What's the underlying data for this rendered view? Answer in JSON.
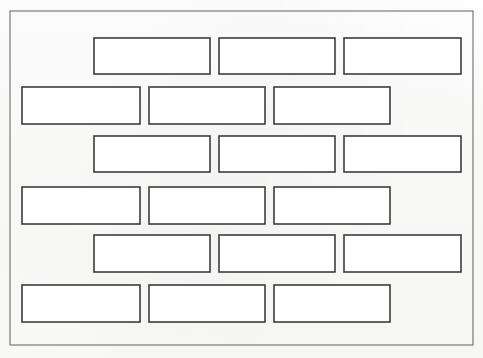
{
  "document": {
    "title": "Brick wall running bond pattern",
    "description": "Hand-drawn line diagram of a brick wall inside a rectangular border",
    "background_color": "#fdfdfc",
    "line_color": "#3c3c3c",
    "frame_color": "#6e6e6e",
    "brick_fill": "#ffffff"
  },
  "canvas": {
    "width": 483,
    "height": 358
  },
  "frame": {
    "name": "outer-border",
    "x": 10,
    "y": 11,
    "width": 463,
    "height": 334
  },
  "wall": {
    "pattern": "running-bond",
    "row_count": 6,
    "brick_count": 21,
    "rows": [
      {
        "index": 1,
        "offset": "indented",
        "bricks": [
          {
            "id": "r1b1",
            "x": 94,
            "y": 38,
            "width": 116,
            "height": 36
          },
          {
            "id": "r1b2",
            "x": 219,
            "y": 38,
            "width": 116,
            "height": 36
          },
          {
            "id": "r1b3",
            "x": 344,
            "y": 38,
            "width": 117,
            "height": 36
          }
        ]
      },
      {
        "index": 2,
        "offset": "flush-left",
        "bricks": [
          {
            "id": "r2b1",
            "x": 22,
            "y": 87,
            "width": 118,
            "height": 37
          },
          {
            "id": "r2b2",
            "x": 149,
            "y": 87,
            "width": 116,
            "height": 37
          },
          {
            "id": "r2b3",
            "x": 274,
            "y": 87,
            "width": 116,
            "height": 37
          }
        ]
      },
      {
        "index": 3,
        "offset": "indented",
        "bricks": [
          {
            "id": "r3b1",
            "x": 94,
            "y": 136,
            "width": 116,
            "height": 36
          },
          {
            "id": "r3b2",
            "x": 219,
            "y": 136,
            "width": 116,
            "height": 36
          },
          {
            "id": "r3b3",
            "x": 344,
            "y": 136,
            "width": 117,
            "height": 36
          }
        ]
      },
      {
        "index": 4,
        "offset": "flush-left",
        "bricks": [
          {
            "id": "r4b1",
            "x": 22,
            "y": 187,
            "width": 118,
            "height": 37
          },
          {
            "id": "r4b2",
            "x": 149,
            "y": 187,
            "width": 116,
            "height": 37
          },
          {
            "id": "r4b3",
            "x": 274,
            "y": 187,
            "width": 116,
            "height": 37
          }
        ]
      },
      {
        "index": 5,
        "offset": "indented",
        "bricks": [
          {
            "id": "r5b1",
            "x": 94,
            "y": 235,
            "width": 116,
            "height": 37
          },
          {
            "id": "r5b2",
            "x": 219,
            "y": 235,
            "width": 116,
            "height": 37
          },
          {
            "id": "r5b3",
            "x": 344,
            "y": 235,
            "width": 117,
            "height": 37
          }
        ]
      },
      {
        "index": 6,
        "offset": "flush-left",
        "bricks": [
          {
            "id": "r6b1",
            "x": 22,
            "y": 285,
            "width": 118,
            "height": 37
          },
          {
            "id": "r6b2",
            "x": 149,
            "y": 285,
            "width": 116,
            "height": 37
          },
          {
            "id": "r6b3",
            "x": 274,
            "y": 285,
            "width": 116,
            "height": 37
          }
        ]
      }
    ]
  }
}
